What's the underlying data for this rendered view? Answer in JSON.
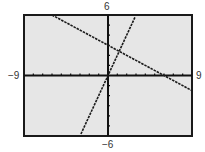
{
  "chart_data": {
    "type": "line",
    "title": "",
    "xlabel": "",
    "ylabel": "",
    "xlim": [
      -9,
      9
    ],
    "ylim": [
      -6,
      6
    ],
    "xscl": 1,
    "yscl": 1,
    "grid": false,
    "legend": null,
    "window_labels": {
      "xmin": "−9",
      "xmax": "9",
      "ymin": "−6",
      "ymax": "6"
    },
    "series": [
      {
        "name": "y = -0.5x + 3",
        "slope": -0.5,
        "intercept": 3,
        "x": [
          -6,
          9
        ],
        "y": [
          6,
          -1.5
        ]
      },
      {
        "name": "y = 2x",
        "slope": 2,
        "intercept": 0,
        "x": [
          -2.9,
          2.9
        ],
        "y": [
          -5.8,
          5.8
        ]
      }
    ],
    "intersection": {
      "x": 1.2,
      "y": 2.4
    }
  },
  "colors": {
    "screen_bg": "#e6e6e6",
    "frame": "#1a1a1a",
    "axis": "#111111",
    "line": "#1a1a1a"
  }
}
